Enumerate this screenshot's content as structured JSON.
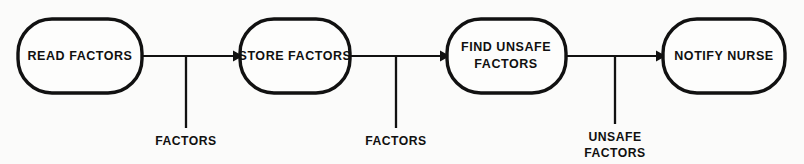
{
  "diagram": {
    "type": "data-flow-diagram",
    "background_color": "#fbfbfa",
    "line_color": "#111111",
    "nodes": [
      {
        "id": "read-factors",
        "label_lines": [
          "READ FACTORS"
        ],
        "line1": "READ FACTORS",
        "line2": "",
        "x": 18,
        "y": 19,
        "w": 124,
        "h": 74
      },
      {
        "id": "store-factors",
        "label_lines": [
          "STORE FACTORS"
        ],
        "line1": "STORE FACTORS",
        "line2": "",
        "x": 240,
        "y": 19,
        "w": 110,
        "h": 74
      },
      {
        "id": "find-unsafe-factors",
        "label_lines": [
          "FIND UNSAFE",
          "FACTORS"
        ],
        "line1": "FIND UNSAFE",
        "line2": "FACTORS",
        "x": 447,
        "y": 19,
        "w": 119,
        "h": 74
      },
      {
        "id": "notify-nurse",
        "label_lines": [
          "NOTIFY NURSE"
        ],
        "line1": "NOTIFY NURSE",
        "line2": "",
        "x": 663,
        "y": 19,
        "w": 122,
        "h": 74
      }
    ],
    "flows": [
      {
        "id": "flow-factors-1",
        "from": "read-factors",
        "to": "store-factors",
        "line1": "FACTORS",
        "line2": "",
        "x1": 142,
        "x2": 240,
        "y": 56,
        "tick_x": 186,
        "tick_y2": 128,
        "label_x": 186,
        "label_y": 145
      },
      {
        "id": "flow-factors-2",
        "from": "store-factors",
        "to": "find-unsafe-factors",
        "line1": "FACTORS",
        "line2": "",
        "x1": 350,
        "x2": 447,
        "y": 56,
        "tick_x": 396,
        "tick_y2": 128,
        "label_x": 396,
        "label_y": 145
      },
      {
        "id": "flow-unsafe-factors",
        "from": "find-unsafe-factors",
        "to": "notify-nurse",
        "line1": "UNSAFE",
        "line2": "FACTORS",
        "x1": 566,
        "x2": 663,
        "y": 56,
        "tick_x": 615,
        "tick_y2": 124,
        "label_x": 615,
        "label_y": 141
      }
    ]
  }
}
